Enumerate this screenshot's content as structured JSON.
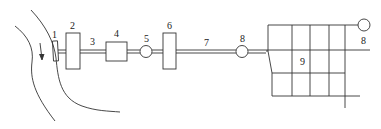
{
  "diagram": {
    "type": "water-supply-system-schematic",
    "labels": {
      "intake": "1",
      "pump_station_1": "2",
      "raw_water_pipe": "3",
      "treatment_unit": "4",
      "pump_5": "5",
      "clear_water_unit": "6",
      "transmission_main": "7",
      "tower_8a": "8",
      "network": "9",
      "tower_8b": "8"
    },
    "colors": {
      "stroke": "#333333",
      "background": "#ffffff"
    },
    "flow_arrow": "down-arrow-in-river"
  }
}
